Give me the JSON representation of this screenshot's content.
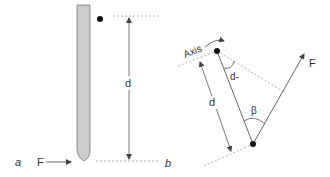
{
  "panels": {
    "a": {
      "label": "a",
      "force_label": "F",
      "distance_label": "d"
    },
    "b": {
      "label": "b",
      "axis_label": "Axis",
      "force_label": "F",
      "distance_label": "d",
      "perp_distance_label": "d-",
      "angle_label": "β"
    }
  },
  "colors": {
    "rod_fill": "#cccccc",
    "rod_stroke": "#666666",
    "line": "#555555",
    "dashed": "#999999",
    "dot": "#111111",
    "text": "#333333"
  }
}
